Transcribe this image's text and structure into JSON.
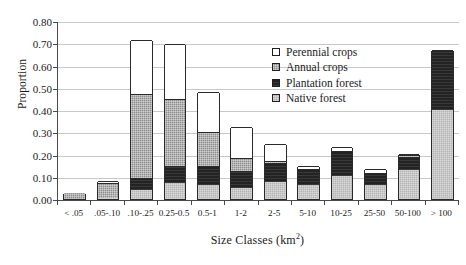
{
  "chart_data": {
    "type": "bar",
    "subtype": "stacked-bar",
    "title": "",
    "xlabel": "Size Classes (km2)",
    "xlabel_base": "Size Classes (km",
    "xlabel_sup": "2",
    "xlabel_close": ")",
    "ylabel": "Proportion",
    "ylim": [
      0.0,
      0.8
    ],
    "ytick_values": [
      0.0,
      0.1,
      0.2,
      0.3,
      0.4,
      0.5,
      0.6,
      0.7,
      0.8
    ],
    "ytick_labels": [
      "0.00",
      "0.10",
      "0.20",
      "0.30",
      "0.40",
      "0.50",
      "0.60",
      "0.70",
      "0.80"
    ],
    "grid": true,
    "grid_axis": "y",
    "legend_position": "inside-upper-right",
    "categories": [
      "< .05",
      ".05-.10",
      ".10-.25",
      "0.25-0.5",
      "0.5-1",
      "1-2",
      "2-5",
      "5-10",
      "10-25",
      "25-50",
      "50-100",
      "> 100"
    ],
    "series": [
      {
        "name": "Native forest",
        "key": "native",
        "color": "#b4b4b4",
        "values": [
          0.0,
          0.005,
          0.04,
          0.072,
          0.065,
          0.048,
          0.075,
          0.065,
          0.105,
          0.065,
          0.13,
          0.4
        ]
      },
      {
        "name": "Plantation forest",
        "key": "plantation",
        "color": "#232323",
        "values": [
          0.0,
          0.0,
          0.055,
          0.078,
          0.085,
          0.08,
          0.085,
          0.07,
          0.11,
          0.05,
          0.06,
          0.27
        ]
      },
      {
        "name": "Annual crops",
        "key": "annual",
        "color": "#8d8d8d",
        "values": [
          0.025,
          0.065,
          0.375,
          0.3,
          0.15,
          0.055,
          0.013,
          0.0,
          0.0,
          0.0,
          0.008,
          0.0
        ]
      },
      {
        "name": "Perennial crops",
        "key": "perennial",
        "color": "#ffffff",
        "values": [
          0.0,
          0.01,
          0.245,
          0.245,
          0.18,
          0.14,
          0.075,
          0.015,
          0.02,
          0.02,
          0.005,
          0.0
        ]
      }
    ],
    "totals": [
      0.025,
      0.08,
      0.715,
      0.695,
      0.48,
      0.323,
      0.248,
      0.15,
      0.235,
      0.135,
      0.203,
      0.67
    ]
  },
  "legend": {
    "items": [
      {
        "label": "Perennial crops",
        "key": "perennial"
      },
      {
        "label": "Annual crops",
        "key": "annual"
      },
      {
        "label": "Plantation forest",
        "key": "plantation"
      },
      {
        "label": "Native forest",
        "key": "native"
      }
    ]
  }
}
